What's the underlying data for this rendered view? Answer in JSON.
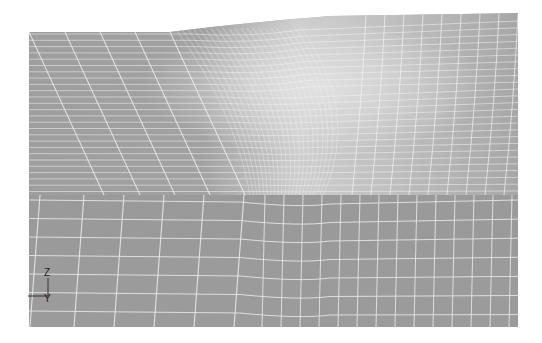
{
  "view": {
    "type": "finite-element-mesh",
    "background_color": "#ffffff",
    "surface_color": "#9d9d9d",
    "highlight_color": "#d8d8d8",
    "mesh_line_color": "#f2f2f2",
    "bounds": {
      "left": 29,
      "right": 518,
      "top_left": 32,
      "top_right": 14,
      "bottom": 327
    },
    "upper_region_bottom": 195
  },
  "triad": {
    "axes": [
      {
        "label": "Z",
        "direction": "up"
      },
      {
        "label": "Y",
        "direction": "right"
      }
    ]
  }
}
